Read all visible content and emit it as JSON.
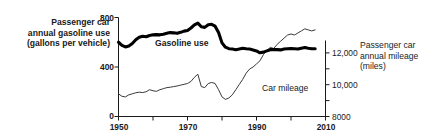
{
  "chart_data": {
    "type": "line",
    "title": "",
    "xlabel": "",
    "xlim": [
      1950,
      2010
    ],
    "x_major_ticks": [
      1950,
      1970,
      1990,
      2010
    ],
    "x_minor_ticks": [
      1960,
      1980,
      2000
    ],
    "x_tick_labels": [
      "1950",
      "1970",
      "1990",
      "2010"
    ],
    "grid": false,
    "legend": "inline-annotations",
    "axes": {
      "left": {
        "label": "Passenger car annual gasoline use (gallons per vehicle)",
        "label_lines": [
          "Passenger car",
          "annual gasoline use",
          "(gallons per vehicle)"
        ],
        "ylim": [
          0,
          800
        ],
        "ticks": [
          0,
          400,
          800
        ],
        "tick_labels": [
          "0",
          "400",
          "800"
        ],
        "units": "gallons per vehicle"
      },
      "right": {
        "label": "Passenger car annual mileage (miles)",
        "label_lines": [
          "Passenger car",
          "annual mileage",
          "(miles)"
        ],
        "ylim": [
          8000,
          12800
        ],
        "ticks": [
          8000,
          10000,
          12000
        ],
        "tick_labels": [
          "8000",
          "10,000",
          "12,000"
        ],
        "units": "miles"
      }
    },
    "series": [
      {
        "name": "Gasoline use",
        "label": "Gasoline use",
        "axis": "left",
        "style": "thick-black",
        "color": "#000000",
        "x": [
          1950,
          1951,
          1952,
          1953,
          1954,
          1955,
          1956,
          1957,
          1958,
          1959,
          1960,
          1961,
          1962,
          1963,
          1964,
          1965,
          1966,
          1967,
          1968,
          1969,
          1970,
          1971,
          1972,
          1973,
          1974,
          1975,
          1976,
          1977,
          1978,
          1979,
          1980,
          1981,
          1982,
          1983,
          1984,
          1985,
          1986,
          1987,
          1988,
          1989,
          1990,
          1991,
          1992,
          1993,
          1994,
          1995,
          1996,
          1997,
          1998,
          1999,
          2000,
          2001,
          2002,
          2003,
          2004,
          2005,
          2006,
          2007
        ],
        "values": [
          600,
          575,
          562,
          570,
          590,
          620,
          640,
          648,
          645,
          655,
          660,
          662,
          660,
          665,
          672,
          678,
          676,
          672,
          680,
          690,
          695,
          715,
          740,
          755,
          725,
          720,
          742,
          745,
          730,
          678,
          595,
          560,
          548,
          545,
          540,
          545,
          552,
          548,
          545,
          538,
          530,
          515,
          520,
          530,
          540,
          542,
          540,
          538,
          545,
          548,
          550,
          548,
          545,
          552,
          558,
          552,
          548,
          548
        ]
      },
      {
        "name": "Car mileage",
        "label": "Car mileage",
        "axis": "right",
        "style": "thin-gray",
        "color": "#3a3a3a",
        "x": [
          1950,
          1951,
          1952,
          1953,
          1954,
          1955,
          1956,
          1957,
          1958,
          1959,
          1960,
          1961,
          1962,
          1963,
          1964,
          1965,
          1966,
          1967,
          1968,
          1969,
          1970,
          1971,
          1972,
          1973,
          1974,
          1975,
          1976,
          1977,
          1978,
          1979,
          1980,
          1981,
          1982,
          1983,
          1984,
          1985,
          1986,
          1987,
          1988,
          1989,
          1990,
          1991,
          1992,
          1993,
          1994,
          1995,
          1996,
          1997,
          1998,
          1999,
          2000,
          2001,
          2002,
          2003,
          2004,
          2005,
          2006,
          2007
        ],
        "values": [
          9100,
          8980,
          8950,
          9050,
          9100,
          9150,
          9180,
          9160,
          9200,
          9300,
          9250,
          9220,
          9300,
          9350,
          9400,
          9420,
          9450,
          9480,
          9520,
          9560,
          9600,
          9700,
          9900,
          10050,
          9450,
          9400,
          9600,
          9650,
          9600,
          9300,
          8950,
          8830,
          8900,
          9050,
          9300,
          9550,
          9800,
          10100,
          10300,
          10400,
          10550,
          10700,
          11000,
          11200,
          11350,
          11300,
          11500,
          11650,
          11800,
          11950,
          12000,
          11950,
          12050,
          12150,
          12250,
          12200,
          12150,
          12200
        ]
      }
    ],
    "annotations": [
      {
        "text": "Gasoline use",
        "series": "Gasoline use"
      },
      {
        "text": "Car mileage",
        "series": "Car mileage"
      }
    ]
  }
}
